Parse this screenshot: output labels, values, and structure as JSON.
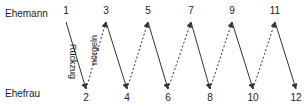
{
  "diagram": {
    "rows": {
      "top_label": "Ehemann",
      "bottom_label": "Ehefrau"
    },
    "edge_labels": {
      "solid": "Rückzug",
      "dashed": "nörgeln"
    },
    "nodes": [
      {
        "id": "1",
        "label": "1",
        "row": "top",
        "x": 66
      },
      {
        "id": "2",
        "label": "2",
        "row": "bottom",
        "x": 86
      },
      {
        "id": "3",
        "label": "3",
        "row": "top",
        "x": 106
      },
      {
        "id": "4",
        "label": "4",
        "row": "bottom",
        "x": 127
      },
      {
        "id": "5",
        "label": "5",
        "row": "top",
        "x": 148
      },
      {
        "id": "6",
        "label": "6",
        "row": "bottom",
        "x": 168
      },
      {
        "id": "7",
        "label": "7",
        "row": "top",
        "x": 191
      },
      {
        "id": "8",
        "label": "8",
        "row": "bottom",
        "x": 210
      },
      {
        "id": "9",
        "label": "9",
        "row": "top",
        "x": 232
      },
      {
        "id": "10",
        "label": "10",
        "row": "bottom",
        "x": 253
      },
      {
        "id": "11",
        "label": "11",
        "row": "top",
        "x": 275
      },
      {
        "id": "12",
        "label": "12",
        "row": "bottom",
        "x": 296
      }
    ],
    "edges": [
      {
        "from": "1",
        "to": "2",
        "style": "solid"
      },
      {
        "from": "2",
        "to": "3",
        "style": "dashed"
      },
      {
        "from": "3",
        "to": "4",
        "style": "solid"
      },
      {
        "from": "4",
        "to": "5",
        "style": "dashed"
      },
      {
        "from": "5",
        "to": "6",
        "style": "solid"
      },
      {
        "from": "6",
        "to": "7",
        "style": "dashed"
      },
      {
        "from": "7",
        "to": "8",
        "style": "solid"
      },
      {
        "from": "8",
        "to": "9",
        "style": "dashed"
      },
      {
        "from": "9",
        "to": "10",
        "style": "solid"
      },
      {
        "from": "10",
        "to": "11",
        "style": "dashed"
      },
      {
        "from": "11",
        "to": "12",
        "style": "solid"
      }
    ],
    "colors": {
      "line": "#333333",
      "text": "#222222"
    }
  }
}
